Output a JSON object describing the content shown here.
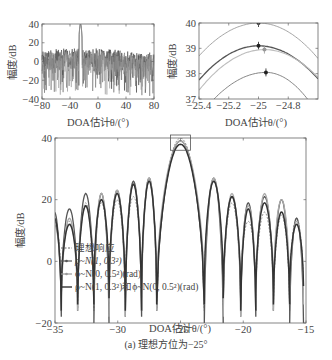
{
  "figure": {
    "caption": "(a) 理想方位为−25°"
  },
  "chart_data": [
    {
      "id": "overview",
      "type": "line",
      "xlabel": "DOA估计θ/(°)",
      "ylabel": "幅度/dB",
      "xlim": [
        -80,
        80
      ],
      "ylim": [
        -40,
        40
      ],
      "xticks": [
        -80,
        -40,
        0,
        40,
        80
      ],
      "yticks": [
        -40,
        -20,
        0,
        20,
        40
      ],
      "xtick_labels": [
        "−80",
        "−40",
        "0",
        "40",
        "80"
      ],
      "ytick_labels": [
        "−40",
        "−20",
        "0",
        "20",
        "40"
      ],
      "peak": {
        "x": -25,
        "y": 40
      },
      "sidelobe_level_approx": 15,
      "description": "Full-range beam pattern; main lobe at −25°, dense sidelobes between about −40 and 20 dB"
    },
    {
      "id": "zoom-peak",
      "type": "line",
      "xlabel": "DOA估计θ/(°)",
      "ylabel": "幅度/dB",
      "xlim": [
        -25.4,
        -24.6
      ],
      "ylim": [
        37,
        40
      ],
      "xticks": [
        -25.4,
        -25.2,
        -25,
        -24.8
      ],
      "yticks": [
        37,
        38,
        39,
        40
      ],
      "xtick_labels": [
        "−25.4",
        "−25.2",
        "−25",
        "−24.8"
      ],
      "ytick_labels": [
        "37",
        "38",
        "39",
        "40"
      ],
      "series": [
        {
          "name": "理想响应",
          "peak_x": -25.0,
          "peak_y": 40.0,
          "y_at_xlim": [
            38.7,
            38.6
          ],
          "color": "#9a9a9a"
        },
        {
          "name": "ρ~N(1, 0.3²)",
          "peak_x": -25.0,
          "peak_y": 39.1,
          "y_at_xlim": [
            37.75,
            37.8
          ],
          "color": "#555555"
        },
        {
          "name": "ϕ~N(0, 0.5²)(rad)",
          "peak_x": -24.96,
          "peak_y": 38.95,
          "y_at_xlim": [
            37.35,
            37.85
          ],
          "color": "#bdbdbd"
        },
        {
          "name": "ρ~N(1, 0.3²)和ϕ~N(0, 0.5²)(rad)",
          "peak_x": -24.95,
          "peak_y": 38.05,
          "y_at_xlim": [
            36.3,
            36.4
          ],
          "color": "#777777"
        }
      ]
    },
    {
      "id": "main",
      "type": "line",
      "xlabel": "DOA估计θ/(°)",
      "ylabel": "幅度/dB",
      "xlim": [
        -35,
        -15
      ],
      "ylim": [
        -20,
        40
      ],
      "xticks": [
        -35,
        -30,
        -25,
        -20,
        -15
      ],
      "yticks": [
        -20,
        0,
        20,
        40
      ],
      "xtick_labels": [
        "−35",
        "−30",
        "−25",
        "−20",
        "−15"
      ],
      "ytick_labels": [
        "−20",
        "0",
        "20",
        "40"
      ],
      "legend_position": "bottom-left",
      "zoom_box": {
        "x": [
          -25.4,
          -24.6
        ],
        "y": [
          37,
          40
        ]
      },
      "nulls_x": [
        -34.5,
        -33.2,
        -31.9,
        -30.7,
        -29.4,
        -28.1,
        -26.9,
        -23.1,
        -21.6,
        -20.2,
        -19.0,
        -17.6,
        -16.3,
        -15.2
      ],
      "series": [
        {
          "name": "理想响应",
          "style": "dashed",
          "color": "#888888",
          "lobe_peaks": [
            13,
            13,
            19,
            19,
            20,
            21,
            26,
            40,
            26,
            19,
            13,
            16,
            15,
            14
          ]
        },
        {
          "name": "ρ~N(1, 0.3²)",
          "style": "marker-line",
          "color": "#555555",
          "lobe_peaks": [
            16,
            17,
            22,
            22,
            23,
            26,
            27,
            39.1,
            27,
            21,
            19,
            21,
            20,
            14
          ]
        },
        {
          "name": "ϕ~N(0, 0.5²)(rad)",
          "style": "marker-line",
          "color": "#aaaaaa",
          "lobe_peaks": [
            12,
            14,
            18,
            22,
            23,
            25,
            27,
            39,
            27,
            22,
            18,
            22,
            20,
            13
          ]
        },
        {
          "name": "ρ~N(1, 0.3²)和ϕ~N(0, 0.5²)(rad)",
          "style": "solid",
          "color": "#333333",
          "lobe_peaks": [
            14,
            12,
            18,
            20,
            22,
            25,
            26,
            38,
            26,
            21,
            17,
            19,
            16,
            12
          ]
        }
      ]
    }
  ],
  "legend": {
    "items": [
      {
        "label_pre": "理想响应",
        "marker": "dashed"
      },
      {
        "label_pre": "ρ~N(1, 0.3²)",
        "marker": "dot-line"
      },
      {
        "label_pre": "ϕ~N(0, 0.5²)(rad)",
        "marker": "dot-line"
      },
      {
        "label_pre": "ρ~N(1, 0.3²)和ϕ~N(0, 0.5²)(rad)",
        "marker": "solid"
      }
    ]
  }
}
